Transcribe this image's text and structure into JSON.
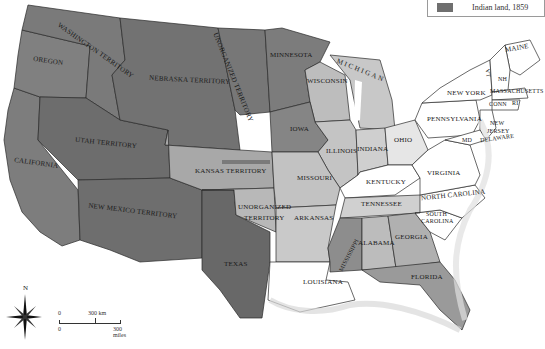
{
  "legend": {
    "items": [
      {
        "label": "Indian land, 1859",
        "color": "#6f6f6f"
      }
    ]
  },
  "compass": {
    "north_label": "N"
  },
  "scale_bar": {
    "km_start": "0",
    "km_end": "300 km",
    "mi_start": "0",
    "mi_end": "300 miles"
  },
  "colors": {
    "indian_land_dark": "#6f6f6f",
    "indian_land_mid": "#8c8c8c",
    "light_state": "#d4d4d4",
    "white_state": "#ffffff",
    "border": "#2a2a2a",
    "water": "#ffffff"
  },
  "regions": {
    "washington": "WASHINGTON TERRITORY",
    "oregon": "OREGON",
    "nebraska": "NEBRASKA TERRITORY",
    "unorganized_north": "UNORGANIZED TERRITORY",
    "minnesota": "MINNESOTA",
    "wisconsin": "WISCONSIN",
    "michigan": "MICHIGAN",
    "iowa": "IOWA",
    "illinois": "ILLINOIS",
    "indiana": "INDIANA",
    "ohio": "OHIO",
    "new_york": "NEW YORK",
    "maine": "MAINE",
    "vt": "VT",
    "nh": "NH",
    "massachusetts": "MASSACHUSETTS",
    "conn": "CONN",
    "ri": "RI",
    "pennsylvania": "PENNSYLVANIA",
    "new_jersey_1": "NEW",
    "new_jersey_2": "JERSEY",
    "delaware": "DELAWARE",
    "md": "MD",
    "virginia": "VIRGINIA",
    "kentucky": "KENTUCKY",
    "north_carolina": "NORTH CAROLINA",
    "tennessee": "TENNESSEE",
    "south_carolina_1": "SOUTH",
    "south_carolina_2": "CAROLINA",
    "georgia": "GEORGIA",
    "alabama": "ALABAMA",
    "mississippi": "MISSISSIPPI",
    "florida": "FLORIDA",
    "louisiana": "LOUISIANA",
    "arkansas": "ARKANSAS",
    "missouri": "MISSOURI",
    "kansas": "KANSAS TERRITORY",
    "unorganized_south_1": "UNORGANIZED",
    "unorganized_south_2": "TERRITORY",
    "texas": "TEXAS",
    "utah": "UTAH TERRITORY",
    "new_mexico": "NEW MEXICO TERRITORY",
    "california": "CALIFORNIA"
  }
}
